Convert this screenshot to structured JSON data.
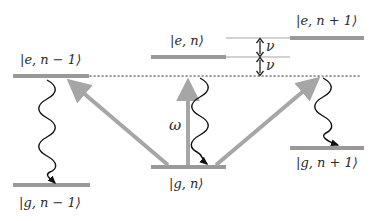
{
  "diagram": {
    "colors": {
      "level": "#999999",
      "pump_arrow": "#a6a6a6",
      "decay": "#111111",
      "guide": "#9a9a9a",
      "dotted": "#333333",
      "text": "#2a2a2a"
    },
    "levels": [
      {
        "id": "e_nm1",
        "label_state": "e",
        "label_n": "n − 1",
        "x1": 13,
        "x2": 89,
        "y": 76
      },
      {
        "id": "e_n",
        "label_state": "e",
        "label_n": "n",
        "x1": 151,
        "x2": 226,
        "y": 57
      },
      {
        "id": "e_np1",
        "label_state": "e",
        "label_n": "n + 1",
        "x1": 290,
        "x2": 364,
        "y": 38
      },
      {
        "id": "g_nm1",
        "label_state": "g",
        "label_n": "n − 1",
        "x1": 13,
        "x2": 90,
        "y": 185
      },
      {
        "id": "g_n",
        "label_state": "g",
        "label_n": "n",
        "x1": 151,
        "x2": 226,
        "y": 167
      },
      {
        "id": "g_np1",
        "label_state": "g",
        "label_n": "n + 1",
        "x1": 290,
        "x2": 364,
        "y": 148
      }
    ],
    "labels": {
      "e_nm1": "|e, n − 1⟩",
      "e_n": "|e, n⟩",
      "e_np1": "|e, n + 1⟩",
      "g_nm1": "|g, n − 1⟩",
      "g_n": "|g, n⟩",
      "g_np1": "|g, n + 1⟩",
      "omega": "ω",
      "nu_upper": "ν",
      "nu_lower": "ν"
    },
    "pump_arrows": [
      {
        "name": "red-sideband-arrow",
        "from": "g_n",
        "to": "e_nm1"
      },
      {
        "name": "carrier-arrow",
        "from": "g_n",
        "to": "virtual_level",
        "label": "ω"
      },
      {
        "name": "blue-sideband-arrow",
        "from": "g_n",
        "to": "e_np1"
      }
    ],
    "decays": [
      {
        "name": "decay-e-nm1-to-g-nm1",
        "from": "e_nm1",
        "to": "g_nm1"
      },
      {
        "name": "decay-carrier-to-g-n",
        "from": "virtual_level",
        "to": "g_n"
      },
      {
        "name": "decay-to-g-np1",
        "from": "virtual_level",
        "to": "g_np1"
      }
    ],
    "spacing": [
      {
        "label": "ν",
        "between": [
          "e_np1 guide",
          "e_n guide"
        ]
      },
      {
        "label": "ν",
        "between": [
          "e_n guide",
          "virtual_level"
        ]
      }
    ]
  }
}
